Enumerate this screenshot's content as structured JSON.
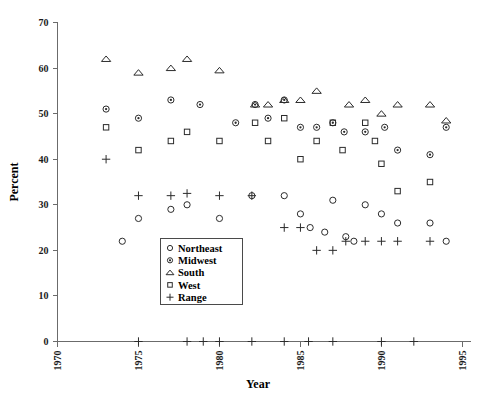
{
  "chart_data": {
    "type": "scatter",
    "title": "",
    "xlabel": "Year",
    "ylabel": "Percent",
    "xlim": [
      1970,
      1995.5
    ],
    "ylim": [
      0,
      70
    ],
    "xticks": [
      1970,
      1975,
      1980,
      1985,
      1990,
      1995
    ],
    "xticklabels": [
      "1970",
      "1975",
      "1980",
      "1985",
      "1990",
      "1995"
    ],
    "yticks": [
      0,
      10,
      20,
      30,
      40,
      50,
      60,
      70
    ],
    "yticklabels": [
      "0",
      "10",
      "20",
      "30",
      "40",
      "50",
      "60",
      "70"
    ],
    "grid": false,
    "legend_position": "lower-center",
    "series": [
      {
        "name": "Northeast",
        "marker": "open-circle",
        "points": [
          {
            "x": 1974,
            "y": 22
          },
          {
            "x": 1975,
            "y": 27
          },
          {
            "x": 1977,
            "y": 29
          },
          {
            "x": 1978,
            "y": 30
          },
          {
            "x": 1980,
            "y": 27
          },
          {
            "x": 1982,
            "y": 32
          },
          {
            "x": 1984,
            "y": 32
          },
          {
            "x": 1985,
            "y": 28
          },
          {
            "x": 1985.6,
            "y": 25
          },
          {
            "x": 1986.5,
            "y": 24
          },
          {
            "x": 1987,
            "y": 31
          },
          {
            "x": 1987.8,
            "y": 23
          },
          {
            "x": 1988.3,
            "y": 22
          },
          {
            "x": 1989,
            "y": 30
          },
          {
            "x": 1990,
            "y": 28
          },
          {
            "x": 1991,
            "y": 26
          },
          {
            "x": 1993,
            "y": 26
          },
          {
            "x": 1994,
            "y": 22
          }
        ]
      },
      {
        "name": "Midwest",
        "marker": "dot-circle",
        "points": [
          {
            "x": 1973,
            "y": 51
          },
          {
            "x": 1975,
            "y": 49
          },
          {
            "x": 1977,
            "y": 53
          },
          {
            "x": 1978.8,
            "y": 52
          },
          {
            "x": 1981,
            "y": 48
          },
          {
            "x": 1982.2,
            "y": 52
          },
          {
            "x": 1983,
            "y": 49
          },
          {
            "x": 1984,
            "y": 53
          },
          {
            "x": 1985,
            "y": 47
          },
          {
            "x": 1986,
            "y": 47
          },
          {
            "x": 1987,
            "y": 48
          },
          {
            "x": 1987.7,
            "y": 46
          },
          {
            "x": 1989,
            "y": 46
          },
          {
            "x": 1990.2,
            "y": 47
          },
          {
            "x": 1991,
            "y": 42
          },
          {
            "x": 1993,
            "y": 41
          },
          {
            "x": 1994,
            "y": 47
          }
        ]
      },
      {
        "name": "South",
        "marker": "triangle",
        "points": [
          {
            "x": 1973,
            "y": 62
          },
          {
            "x": 1975,
            "y": 59
          },
          {
            "x": 1977,
            "y": 60
          },
          {
            "x": 1978,
            "y": 62
          },
          {
            "x": 1980,
            "y": 59.5
          },
          {
            "x": 1982.2,
            "y": 52
          },
          {
            "x": 1983,
            "y": 52
          },
          {
            "x": 1984,
            "y": 53
          },
          {
            "x": 1985,
            "y": 53
          },
          {
            "x": 1986,
            "y": 55
          },
          {
            "x": 1988,
            "y": 52
          },
          {
            "x": 1989,
            "y": 53
          },
          {
            "x": 1990,
            "y": 50
          },
          {
            "x": 1991,
            "y": 52
          },
          {
            "x": 1993,
            "y": 52
          },
          {
            "x": 1994,
            "y": 48.5
          }
        ]
      },
      {
        "name": "West",
        "marker": "square",
        "points": [
          {
            "x": 1973,
            "y": 47
          },
          {
            "x": 1975,
            "y": 42
          },
          {
            "x": 1977,
            "y": 44
          },
          {
            "x": 1978,
            "y": 46
          },
          {
            "x": 1980,
            "y": 44
          },
          {
            "x": 1982.2,
            "y": 48
          },
          {
            "x": 1983,
            "y": 44
          },
          {
            "x": 1984,
            "y": 49
          },
          {
            "x": 1985,
            "y": 40
          },
          {
            "x": 1986,
            "y": 44
          },
          {
            "x": 1987,
            "y": 48
          },
          {
            "x": 1987.6,
            "y": 42
          },
          {
            "x": 1989,
            "y": 48
          },
          {
            "x": 1989.6,
            "y": 44
          },
          {
            "x": 1990,
            "y": 39
          },
          {
            "x": 1991,
            "y": 33
          },
          {
            "x": 1993,
            "y": 35
          }
        ]
      },
      {
        "name": "Range",
        "marker": "plus",
        "points": [
          {
            "x": 1973,
            "y": 40
          },
          {
            "x": 1975,
            "y": 32
          },
          {
            "x": 1977,
            "y": 32
          },
          {
            "x": 1978,
            "y": 32.5
          },
          {
            "x": 1980,
            "y": 32
          },
          {
            "x": 1982,
            "y": 32
          },
          {
            "x": 1984,
            "y": 25
          },
          {
            "x": 1985,
            "y": 25
          },
          {
            "x": 1986,
            "y": 20
          },
          {
            "x": 1987,
            "y": 20
          },
          {
            "x": 1987.8,
            "y": 22
          },
          {
            "x": 1989,
            "y": 22
          },
          {
            "x": 1990,
            "y": 22
          },
          {
            "x": 1991,
            "y": 22
          },
          {
            "x": 1993,
            "y": 22
          },
          {
            "x": 1975,
            "y": 0
          },
          {
            "x": 1978,
            "y": 0
          },
          {
            "x": 1979,
            "y": 0
          },
          {
            "x": 1980,
            "y": 0
          },
          {
            "x": 1982,
            "y": 0
          },
          {
            "x": 1984,
            "y": 0
          },
          {
            "x": 1985.5,
            "y": 0
          },
          {
            "x": 1987,
            "y": 0
          },
          {
            "x": 1990,
            "y": 0
          },
          {
            "x": 1992,
            "y": 0
          }
        ]
      }
    ]
  },
  "legend": {
    "items": [
      {
        "label": "Northeast",
        "marker": "open-circle"
      },
      {
        "label": "Midwest",
        "marker": "dot-circle"
      },
      {
        "label": "South",
        "marker": "triangle"
      },
      {
        "label": "West",
        "marker": "square"
      },
      {
        "label": "Range",
        "marker": "plus"
      }
    ]
  },
  "axes": {
    "x_title": "Year",
    "y_title": "Percent"
  }
}
